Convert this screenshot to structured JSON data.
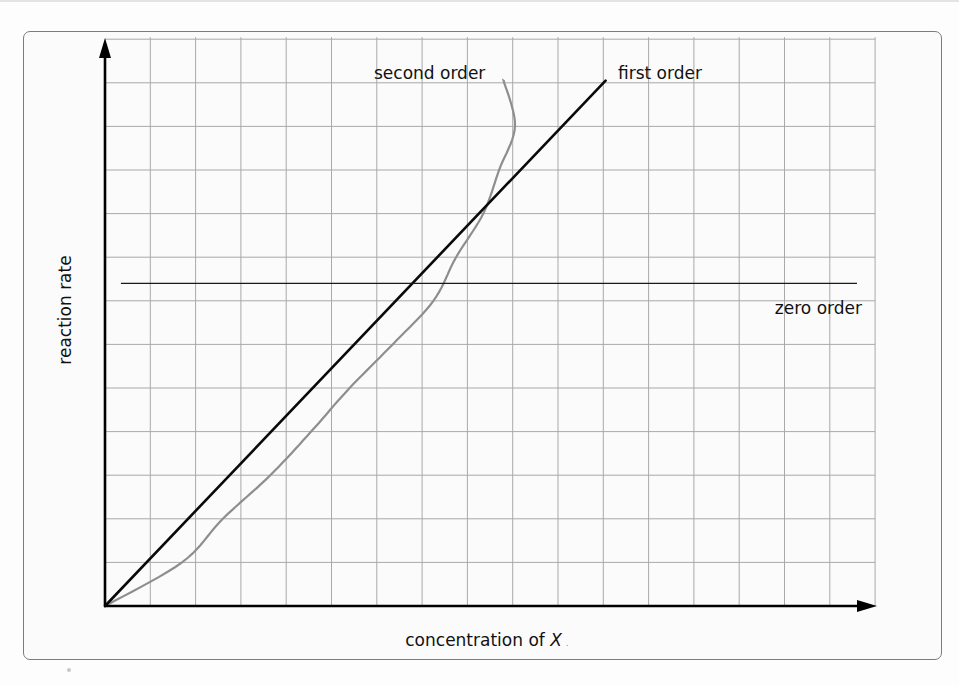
{
  "chart_data": {
    "type": "line",
    "title": "",
    "xlabel": "concentration of X",
    "ylabel": "reaction rate",
    "xlim": [
      0,
      17
    ],
    "ylim": [
      0,
      13
    ],
    "grid": true,
    "grid_divisions": {
      "x": 17,
      "y": 13
    },
    "tick_labels": {
      "x": [],
      "y": []
    },
    "legend": "inline labels",
    "series": [
      {
        "name": "zero order",
        "style": "thin black line",
        "color": "#1a1a1a",
        "points": [
          [
            0.35,
            7.4
          ],
          [
            16.6,
            7.4
          ]
        ]
      },
      {
        "name": "first order",
        "style": "thick black line",
        "color": "#0a0a0a",
        "points": [
          [
            0,
            0
          ],
          [
            11.05,
            12.05
          ]
        ]
      },
      {
        "name": "second order",
        "style": "grey curve",
        "color": "#8e8e8e",
        "points": [
          [
            0,
            0
          ],
          [
            1.7,
            1.0
          ],
          [
            2.6,
            2.0
          ],
          [
            3.65,
            3.0
          ],
          [
            4.55,
            4.0
          ],
          [
            5.4,
            5.0
          ],
          [
            6.35,
            6.0
          ],
          [
            7.25,
            7.0
          ],
          [
            7.75,
            8.0
          ],
          [
            8.35,
            9.0
          ],
          [
            8.7,
            10.0
          ],
          [
            9.05,
            11.0
          ],
          [
            8.8,
            12.05
          ]
        ]
      }
    ],
    "annotations": [
      {
        "text": "second order",
        "near": "top of second-order curve"
      },
      {
        "text": "first order",
        "near": "top of first-order line"
      },
      {
        "text": "zero order",
        "near": "right end of zero-order line, below"
      }
    ],
    "intersection": {
      "series": [
        "first order",
        "second order"
      ],
      "approx": [
        7.3,
        8.0
      ]
    }
  },
  "labels": {
    "second_order": "second order",
    "first_order": "first order",
    "zero_order": "zero order",
    "y_axis": "reaction rate",
    "x_axis_prefix": "concentration of ",
    "x_axis_var": "X",
    "x_axis_suffix": "."
  }
}
